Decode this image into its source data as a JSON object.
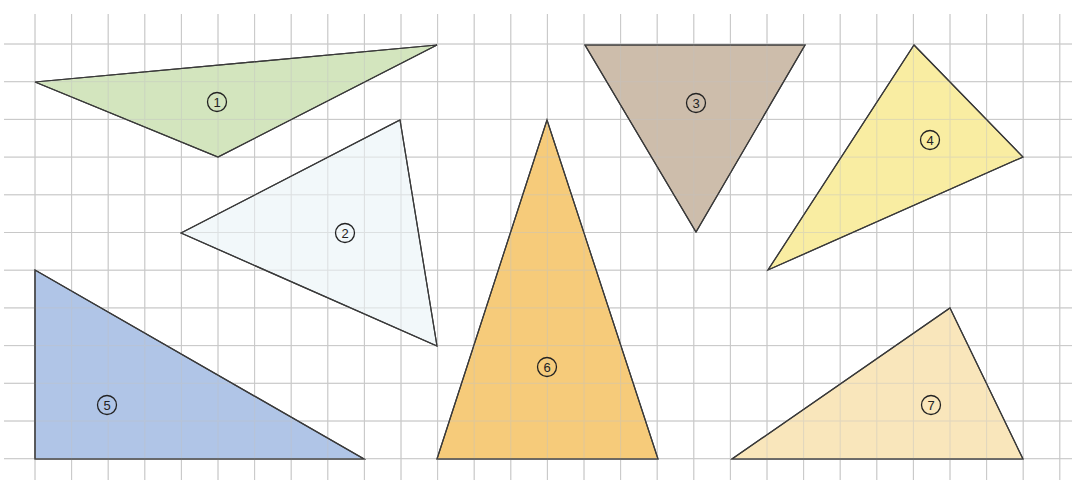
{
  "diagram": {
    "type": "grid-with-triangles",
    "grid": {
      "x_lines": [
        35,
        71.6,
        108.2,
        144.8,
        181.4,
        218,
        254.6,
        291.2,
        327.8,
        364.4,
        401,
        437.6,
        474.2,
        510.8,
        547.4,
        584,
        620.6,
        657.2,
        693.8,
        730.4,
        767,
        803.6,
        840.2,
        876.8,
        913.4,
        950,
        986.6,
        1023.2,
        1059.8
      ],
      "y_lines": [
        44,
        81.7,
        119.4,
        157.1,
        194.8,
        232.5,
        270.2,
        307.9,
        345.6,
        383.3,
        421,
        458.7
      ],
      "x_extent": [
        4,
        1072
      ],
      "y_extent": [
        14,
        480
      ],
      "line_color": "#c8c8c8"
    },
    "stroke_color": "#3a3a3a",
    "triangles": [
      {
        "id": "1",
        "label": "①",
        "fill": "#cfe3b8",
        "points": "35,82 437,45 218,157",
        "label_pos": [
          217,
          102
        ]
      },
      {
        "id": "2",
        "label": "②",
        "fill": "#f1f7fa",
        "points": "181,233 400,120 437,346",
        "label_pos": [
          345,
          233
        ]
      },
      {
        "id": "3",
        "label": "③",
        "fill": "#c9b7a4",
        "points": "585,45 805,45 696,232",
        "label_pos": [
          696,
          103
        ]
      },
      {
        "id": "4",
        "label": "④",
        "fill": "#f8eb9a",
        "points": "914,45 1023,157 768,270",
        "label_pos": [
          930,
          140
        ]
      },
      {
        "id": "5",
        "label": "⑤",
        "fill": "#a9c0e5",
        "points": "35,270 35,459 364,459",
        "label_pos": [
          107,
          405
        ]
      },
      {
        "id": "6",
        "label": "⑥",
        "fill": "#f5c76f",
        "points": "547,120 658,459 437,459",
        "label_pos": [
          547,
          367
        ]
      },
      {
        "id": "7",
        "label": "⑦",
        "fill": "#f9e4b5",
        "points": "950,308 1023,459 732,459",
        "label_pos": [
          931,
          405
        ]
      }
    ]
  }
}
